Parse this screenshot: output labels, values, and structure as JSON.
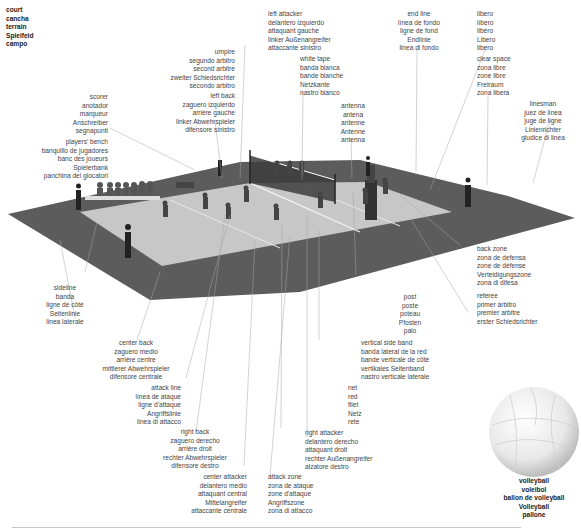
{
  "labels": {
    "court": [
      "court",
      "cancha",
      "terrain",
      "Spielfeld",
      "campo"
    ],
    "scorer": [
      "scorer",
      "anotador",
      "marqueur",
      "Anschreiber",
      "segnapunti"
    ],
    "players_bench": [
      "players' bench",
      "banquillo de jugadores",
      "banc des joueurs",
      "Spielerbank",
      "panchina dei giocatori"
    ],
    "umpire": [
      "umpire",
      "segundo árbitro",
      "second arbitre",
      "zweiter Schiedsrichter",
      "secondo arbitro"
    ],
    "left_back": [
      "left back",
      "zaguero izquierdo",
      "arrière gauche",
      "linker Abwehrspieler",
      "difensore sinistro"
    ],
    "left_attacker": [
      "left attacker",
      "delantero izquierdo",
      "attaquant gauche",
      "linker Außenangreifer",
      "attaccante sinistro"
    ],
    "white_tape": [
      "white tape",
      "banda blanca",
      "bande blanche",
      "Netzkante",
      "nastro bianco"
    ],
    "antenna": [
      "antenna",
      "antena",
      "antenne",
      "Antenne",
      "antenna"
    ],
    "end_line": [
      "end line",
      "línea de fondo",
      "ligne de fond",
      "Endlinie",
      "linea di fondo"
    ],
    "libero": [
      "libero",
      "líbero",
      "libéro",
      "Libero",
      "libero"
    ],
    "clear_space": [
      "clear space",
      "zona libre",
      "zone libre",
      "Freiraum",
      "zona libera"
    ],
    "linesman": [
      "linesman",
      "juez de línea",
      "juge de ligne",
      "Linienrichter",
      "giudice di linea"
    ],
    "back_zone": [
      "back zone",
      "zona de defensa",
      "zone de défense",
      "Verteidigungszone",
      "zona di difesa"
    ],
    "referee": [
      "referee",
      "primer árbitro",
      "premier arbitre",
      "erster Schiedsrichter",
      "primo arbitro"
    ],
    "sideline": [
      "sideline",
      "banda",
      "ligne de côté",
      "Seitenlinie",
      "linea laterale"
    ],
    "center_back": [
      "center back",
      "zaguero medio",
      "arrière centre",
      "mittlerer Abwehrspieler",
      "difensore centrale"
    ],
    "attack_line": [
      "attack line",
      "línea de ataque",
      "ligne d'attaque",
      "Angriffslinie",
      "linea di attacco"
    ],
    "right_back": [
      "right back",
      "zaguero derecho",
      "arrière droit",
      "rechter Abwehrspieler",
      "difensore destro"
    ],
    "center_attacker": [
      "center attacker",
      "delantero medio",
      "attaquant central",
      "Mittelangreifer",
      "attaccante centrale"
    ],
    "attack_zone": [
      "attack zone",
      "zona de ataque",
      "zone d'attaque",
      "Angriffszone",
      "zona di attacco"
    ],
    "right_attacker": [
      "right attacker",
      "delantero derecho",
      "attaquant droit",
      "rechter Außenangreifer",
      "alzatore destro"
    ],
    "net": [
      "net",
      "red",
      "filet",
      "Netz",
      "rete"
    ],
    "vertical_side_band": [
      "vertical side band",
      "banda lateral de la red",
      "bande verticale de côté",
      "vertikales Seitenband",
      "nastro verticale laterale"
    ],
    "post": [
      "post",
      "poste",
      "poteau",
      "Pfosten",
      "palo"
    ],
    "volleyball": [
      "volleyball",
      "voleibol",
      "ballon de volleyball",
      "Volleyball",
      "pallone"
    ]
  },
  "genders": {
    "court": [
      "",
      "F",
      "M",
      "N",
      "M"
    ],
    "scorer": [
      "",
      "M",
      "M",
      "M",
      "M"
    ],
    "players_bench": [
      "",
      "M|M",
      "M|M",
      "F",
      "F|M"
    ],
    "umpire": [
      "",
      "M",
      "M",
      "M",
      "M"
    ],
    "left_back": [
      "",
      "M",
      "M",
      "M",
      "M"
    ],
    "left_attacker": [
      "",
      "M",
      "M",
      "M",
      "M"
    ],
    "white_tape": [
      "",
      "F",
      "F",
      "F",
      "M"
    ],
    "antenna": [
      "",
      "F",
      "F",
      "F",
      "F"
    ],
    "end_line": [
      "",
      "F|M",
      "F|M",
      "F",
      "F|M"
    ],
    "libero": [
      "",
      "M",
      "M",
      "M",
      "M"
    ],
    "clear_space": [
      "",
      "F",
      "F",
      "M",
      "F"
    ],
    "linesman": [
      "",
      "M|F",
      "M|F",
      "M",
      "M|F"
    ],
    "back_zone": [
      "",
      "F|F",
      "F|F",
      "F",
      "F|F"
    ],
    "referee": [
      "",
      "M",
      "M",
      "M",
      "M"
    ],
    "sideline": [
      "",
      "F",
      "F|M",
      "F",
      "F"
    ],
    "center_back": [
      "",
      "M",
      "M",
      "M",
      "M|M"
    ],
    "attack_line": [
      "",
      "F|M",
      "F|F",
      "F",
      "F|M"
    ],
    "right_back": [
      "",
      "M",
      "M",
      "M",
      "M"
    ],
    "center_attacker": [
      "",
      "M",
      "M",
      "M",
      "M|M"
    ],
    "attack_zone": [
      "",
      "F|M",
      "F|F",
      "F",
      "F|M"
    ],
    "right_attacker": [
      "",
      "M",
      "M",
      "M",
      "M"
    ],
    "net": [
      "",
      "F",
      "M",
      "N",
      "F"
    ],
    "vertical_side_band": [
      "",
      "F|F",
      "F|M",
      "N",
      "M"
    ],
    "post": [
      "",
      "M",
      "M",
      "M",
      "M"
    ],
    "volleyball": [
      "",
      "M",
      "M|M",
      "M",
      "M"
    ]
  },
  "colors": {
    "background": "#ffffff",
    "outer_floor": "#5a5a5a",
    "court_surface": "#c9c9c9",
    "leader_line": "#9a9a9a",
    "text": "#3a3a3a"
  }
}
